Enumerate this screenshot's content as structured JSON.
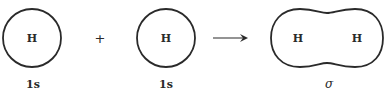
{
  "diagram": {
    "type": "molecular-orbital-formation",
    "stroke_color": "#2a2a2a",
    "left_atom": {
      "symbol": "H",
      "orbital_label": "1s"
    },
    "plus_sign": "+",
    "right_atom": {
      "symbol": "H",
      "orbital_label": "1s"
    },
    "arrow": "→",
    "product": {
      "atoms": [
        "H",
        "H"
      ],
      "orbital_label": "σ"
    }
  }
}
